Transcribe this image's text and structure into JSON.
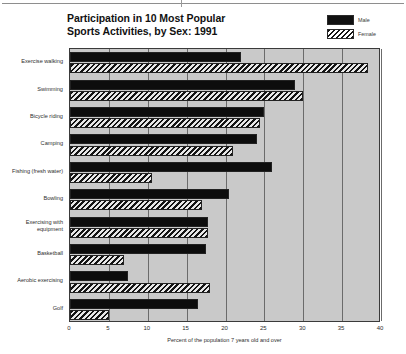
{
  "chart_data": {
    "type": "bar",
    "orientation": "horizontal",
    "title": "Participation in 10 Most Popular Sports Activities, by Sex: 1991",
    "title_line1": "Participation in 10 Most Popular",
    "title_line2": "Sports Activities, by Sex: 1991",
    "xlabel": "Percent of the population 7 years old and over",
    "ylabel": "",
    "xlim": [
      0,
      40
    ],
    "xticks": [
      0,
      5,
      10,
      15,
      20,
      25,
      30,
      35,
      40
    ],
    "xtick_labels": [
      "0",
      "5",
      "10",
      "15",
      "20",
      "25",
      "30",
      "35",
      "40"
    ],
    "grid": true,
    "grid_axis": "x",
    "legend_position": "top-right",
    "categories": [
      "Exercise walking",
      "Swimming",
      "Bicycle riding",
      "Camping",
      "Fishing (fresh water)",
      "Bowling",
      "Exercising with equipment",
      "Basketball",
      "Aerobic exercising",
      "Golf"
    ],
    "series": [
      {
        "name": "Male",
        "color": "#0d0d0d",
        "pattern": "solid",
        "values": [
          22.0,
          29.0,
          25.0,
          24.0,
          26.0,
          20.5,
          17.8,
          17.5,
          7.5,
          16.5
        ]
      },
      {
        "name": "Female",
        "color": "#141414",
        "pattern": "diagonal-hatch",
        "values": [
          38.3,
          30.0,
          24.5,
          21.0,
          10.5,
          17.0,
          17.8,
          7.0,
          18.0,
          5.0
        ]
      }
    ]
  },
  "legend": {
    "entries": [
      {
        "label": "Male",
        "swatch": "solid-black"
      },
      {
        "label": "Female",
        "swatch": "diagonal-hatch"
      }
    ]
  },
  "colors": {
    "plot_background": "#c9c9c9",
    "page_background": "#ffffff",
    "gridline": "#6b6b6b",
    "frame": "#3a3a3a",
    "male_bar": "#0d0d0d",
    "female_bar_hatch": "#141414",
    "text": "#2e2e2e"
  }
}
